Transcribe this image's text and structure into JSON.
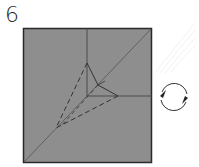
{
  "step": {
    "number": "6"
  },
  "colors": {
    "paper": "#8e8e8e",
    "border": "#2a2a2a",
    "crease": "#444444",
    "arrow": "#333333",
    "background": "#ffffff"
  },
  "diagram": {
    "type": "origami-step",
    "square": {
      "x": 23,
      "y": 28,
      "w": 129,
      "h": 135
    },
    "lines": [
      {
        "kind": "diagonal-valley",
        "from": [
          24,
          162
        ],
        "to": [
          151,
          29
        ]
      },
      {
        "kind": "vertical-crease",
        "from": [
          87,
          28
        ],
        "to": [
          87,
          96
        ]
      },
      {
        "kind": "horizontal-crease",
        "from": [
          87,
          96
        ],
        "to": [
          152,
          96
        ]
      }
    ],
    "flap": {
      "apex": [
        87,
        63
      ],
      "right": [
        118,
        96
      ],
      "inner": [
        98,
        85
      ]
    },
    "dashed_lines": [
      {
        "from": [
          87,
          63
        ],
        "to": [
          56,
          128
        ]
      },
      {
        "from": [
          118,
          96
        ],
        "to": [
          56,
          128
        ]
      },
      {
        "from": [
          98,
          85
        ],
        "to": [
          60,
          126
        ]
      }
    ],
    "turn_over_symbol": {
      "icon": "rotate-arrows-icon",
      "cx": 174,
      "cy": 97,
      "r": 13
    }
  }
}
